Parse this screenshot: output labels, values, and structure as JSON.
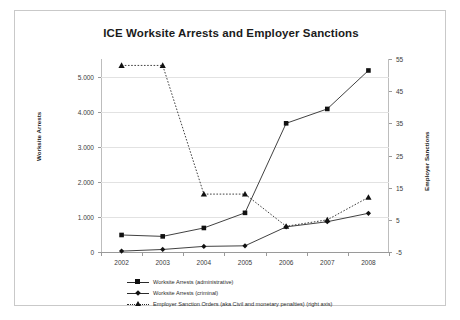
{
  "chart_data": {
    "type": "line",
    "title": "ICE Worksite Arrests and Employer Sanctions",
    "xlabel": "",
    "ylabel": "Worksite Arrests",
    "y2label": "Employer Sanctions",
    "categories": [
      "2002",
      "2003",
      "2004",
      "2005",
      "2006",
      "2007",
      "2008"
    ],
    "ylim": [
      0,
      5500
    ],
    "yticks": [
      "0",
      "1.000",
      "2.000",
      "3.000",
      "4.000",
      "5.000"
    ],
    "ytick_values": [
      0,
      1000,
      2000,
      3000,
      4000,
      5000
    ],
    "y2lim": [
      -5,
      55
    ],
    "y2ticks": [
      "-5",
      "5",
      "15",
      "25",
      "35",
      "45",
      "55"
    ],
    "y2tick_values": [
      -5,
      5,
      15,
      25,
      35,
      45,
      55
    ],
    "grid": true,
    "legend_position": "bottom-left",
    "series": [
      {
        "name": "Worksite Arrests (administrative)",
        "axis": "left",
        "marker": "square",
        "linestyle": "solid",
        "values": [
          485,
          445,
          685,
          1116,
          3667,
          4077,
          5173
        ]
      },
      {
        "name": "Worksite Arrests (criminal)",
        "axis": "left",
        "marker": "diamond",
        "linestyle": "solid",
        "values": [
          25,
          72,
          160,
          176,
          716,
          863,
          1103
        ]
      },
      {
        "name": "Employer Sanction Orders (aka Civil and monetary penalties) (right axis)",
        "axis": "right",
        "marker": "triangle",
        "linestyle": "dotted",
        "values": [
          53,
          53,
          13,
          13,
          3,
          5,
          12
        ]
      }
    ]
  },
  "chart": {
    "title": "ICE Worksite Arrests and Employer Sanctions",
    "axis_title_left": "Worksite Arrests",
    "axis_title_right": "Employer Sanctions"
  },
  "legend": {
    "items": [
      {
        "label": "Worksite Arrests (administrative)"
      },
      {
        "label": "Worksite Arrests (criminal)"
      },
      {
        "label": "Employer Sanction Orders (aka Civil and monetary penalties) (right axis)"
      }
    ]
  },
  "colors": {
    "series_line": "#2b2b2b",
    "grid": "#e2e2e2",
    "axis": "#9a9a9a",
    "frame": "#c9c9c9",
    "text": "#1b1b1b",
    "background": "#ffffff"
  }
}
